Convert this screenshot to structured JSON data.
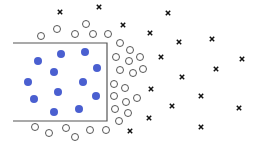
{
  "diagram": {
    "colors": {
      "filled": "#4a5fd0",
      "circle_stroke": "#444444",
      "cross": "#111111",
      "box": "#555555"
    },
    "box": {
      "x1": 13,
      "y1": 43,
      "x2": 107,
      "y2": 121
    },
    "filled_points": [
      [
        38,
        61
      ],
      [
        61,
        54
      ],
      [
        85,
        52
      ],
      [
        97,
        68
      ],
      [
        54,
        72
      ],
      [
        28,
        82
      ],
      [
        83,
        82
      ],
      [
        58,
        92
      ],
      [
        34,
        99
      ],
      [
        96,
        96
      ],
      [
        54,
        112
      ],
      [
        79,
        109
      ]
    ],
    "open_circles": [
      [
        41,
        36
      ],
      [
        57,
        29
      ],
      [
        86,
        24
      ],
      [
        75,
        34
      ],
      [
        93,
        34
      ],
      [
        108,
        34
      ],
      [
        120,
        43
      ],
      [
        130,
        50
      ],
      [
        116,
        57
      ],
      [
        129,
        61
      ],
      [
        140,
        57
      ],
      [
        120,
        70
      ],
      [
        133,
        73
      ],
      [
        143,
        69
      ],
      [
        114,
        84
      ],
      [
        125,
        88
      ],
      [
        114,
        96
      ],
      [
        126,
        102
      ],
      [
        137,
        98
      ],
      [
        115,
        109
      ],
      [
        128,
        113
      ],
      [
        119,
        121
      ],
      [
        106,
        130
      ],
      [
        35,
        127
      ],
      [
        49,
        133
      ],
      [
        66,
        128
      ],
      [
        75,
        137
      ],
      [
        90,
        130
      ]
    ],
    "crosses": [
      [
        60,
        12
      ],
      [
        99,
        7
      ],
      [
        123,
        25
      ],
      [
        168,
        13
      ],
      [
        150,
        33
      ],
      [
        179,
        42
      ],
      [
        212,
        39
      ],
      [
        161,
        57
      ],
      [
        242,
        59
      ],
      [
        216,
        69
      ],
      [
        182,
        77
      ],
      [
        151,
        89
      ],
      [
        201,
        96
      ],
      [
        172,
        106
      ],
      [
        239,
        108
      ],
      [
        149,
        118
      ],
      [
        201,
        127
      ],
      [
        130,
        131
      ]
    ]
  }
}
